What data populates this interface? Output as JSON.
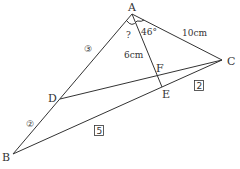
{
  "diagram": {
    "points": {
      "A": {
        "label": "A",
        "x": 132,
        "y": 14
      },
      "B": {
        "label": "B",
        "x": 13,
        "y": 154
      },
      "C": {
        "label": "C",
        "x": 222,
        "y": 60
      },
      "D": {
        "label": "D",
        "x": 60,
        "y": 99
      },
      "E": {
        "label": "E",
        "x": 162,
        "y": 87
      },
      "F": {
        "label": "F",
        "x": 158,
        "y": 76
      }
    },
    "annotations": {
      "unknown_angle": "?",
      "angle_CAE": "46°",
      "AC_length": "10cm",
      "AF_length": "6cm",
      "AD_ratio": "③",
      "DB_ratio": "②",
      "BE_ratio": "5",
      "EC_ratio": "2"
    },
    "line_color": "#333333"
  }
}
